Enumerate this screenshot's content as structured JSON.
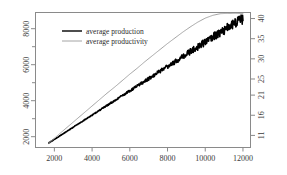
{
  "chart_data": {
    "type": "line",
    "title": "",
    "subtitle": "",
    "xlabel": "",
    "ylabel": "",
    "y2label": "",
    "grid": false,
    "legend_position": "top-left-inside",
    "xlim": [
      1000,
      12400
    ],
    "ylim": [
      1400,
      8900
    ],
    "y2lim": [
      8.0,
      41.5
    ],
    "xticks": [
      2000,
      4000,
      6000,
      8000,
      10000,
      12000
    ],
    "xticklabels": [
      "2000",
      "4000",
      "6000",
      "8000",
      "10000",
      "12000"
    ],
    "yticks": [
      2000,
      4000,
      6000,
      8000
    ],
    "yticklabels": [
      "2000",
      "4000",
      "6000",
      "8000"
    ],
    "y_minor_ticks": [
      1000,
      3000,
      5000,
      7000,
      9000
    ],
    "y2ticks": [
      11,
      16,
      21,
      25,
      30,
      35,
      40
    ],
    "y2ticklabels": [
      "11",
      "16",
      "21",
      "25",
      "30",
      "35",
      "40"
    ],
    "series": [
      {
        "name": "average production",
        "axis": "left",
        "color": "#000000",
        "linewidth": 1.6,
        "noise": "increasing",
        "x": [
          1700,
          2000,
          2400,
          2800,
          3200,
          3600,
          4000,
          4400,
          4800,
          5200,
          5600,
          6000,
          6400,
          6800,
          7200,
          7600,
          8000,
          8400,
          8800,
          9200,
          9600,
          10000,
          10400,
          10800,
          11200,
          11600,
          12000
        ],
        "values": [
          1650,
          1850,
          2120,
          2390,
          2660,
          2930,
          3200,
          3470,
          3740,
          4010,
          4280,
          4550,
          4820,
          5090,
          5360,
          5630,
          5900,
          6170,
          6440,
          6710,
          6980,
          7250,
          7520,
          7790,
          8060,
          8330,
          8560
        ]
      },
      {
        "name": "average productivity",
        "axis": "right",
        "color": "#9a9a9a",
        "linewidth": 0.9,
        "noise": "none",
        "x": [
          1700,
          2000,
          2400,
          2800,
          3200,
          3600,
          4000,
          4400,
          4800,
          5200,
          5600,
          6000,
          6400,
          6800,
          7200,
          7600,
          8000,
          8400,
          8800,
          9200,
          9600,
          10000,
          10400,
          10800,
          11200,
          11600,
          12000
        ],
        "values": [
          9.0,
          10.3,
          11.9,
          13.5,
          15.1,
          16.7,
          18.3,
          19.9,
          21.5,
          23.0,
          24.6,
          26.2,
          27.7,
          29.3,
          30.8,
          32.3,
          33.8,
          35.2,
          36.6,
          37.9,
          39.1,
          40.1,
          40.8,
          41.2,
          41.3,
          41.3,
          41.2
        ]
      }
    ],
    "legend": [
      {
        "label": "average production",
        "color": "#000000",
        "linewidth": 1.4
      },
      {
        "label": "average productivity",
        "color": "#9a9a9a",
        "linewidth": 0.9
      }
    ],
    "colors": {
      "background": "#ffffff",
      "frame": "#8a8a8a",
      "axis_text": "#3a3a3a",
      "production": "#000000",
      "productivity": "#9a9a9a"
    }
  }
}
